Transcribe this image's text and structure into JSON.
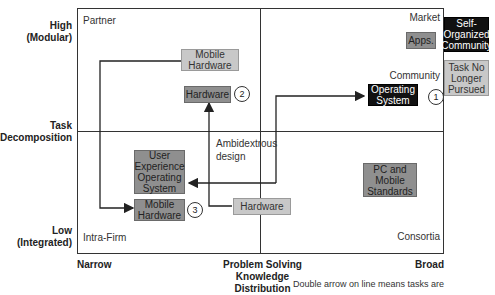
{
  "diagram": {
    "y_axis": {
      "title": "Task Decomposition",
      "title_line1": "Task",
      "title_line2": "Decomposition",
      "high_line1": "High",
      "high_line2": "(Modular)",
      "low_line1": "Low",
      "low_line2": "(Integrated)"
    },
    "x_axis": {
      "title": "Problem Solving Knowledge Distribution",
      "title_line1": "Problem Solving Knowledge",
      "title_line2": "Distribution",
      "left": "Narrow",
      "right": "Broad"
    },
    "quadrants": {
      "top_left": "Partner",
      "top_right_market": "Market",
      "top_right_community": "Community",
      "bottom_left": "Intra-Firm",
      "bottom_right": "Consortia"
    },
    "boxes": {
      "mobile_hardware_partner": {
        "line1": "Mobile",
        "line2": "Hardware"
      },
      "hardware_partner": {
        "line1": "Hardware"
      },
      "apps": {
        "line1": "Apps."
      },
      "self_organized": {
        "line1": "Self-",
        "line2": "Organized",
        "line3": "Community"
      },
      "task_no_longer": {
        "line1": "Task No",
        "line2": "Longer",
        "line3": "Pursued"
      },
      "operating_system_community": {
        "line1": "Operating",
        "line2": "System"
      },
      "ux_os_intrafirm": {
        "line1": "User",
        "line2": "Experience",
        "line3": "Operating",
        "line4": "System"
      },
      "mobile_hardware_intrafirm": {
        "line1": "Mobile",
        "line2": "Hardware"
      },
      "hardware_intrafirm": {
        "line1": "Hardware"
      },
      "pc_mobile_standards": {
        "line1": "PC and",
        "line2": "Mobile",
        "line3": "Standards"
      }
    },
    "markers": {
      "one": "1",
      "two": "2",
      "three": "3"
    },
    "annotation": {
      "line1": "Ambidextrous",
      "line2": "design"
    },
    "footnote": "Double arrow on line means tasks are"
  },
  "colors": {
    "light_box": "#c8c8c8",
    "mid_box": "#8f8f8f",
    "dark_box": "#111111",
    "line": "#333333"
  }
}
